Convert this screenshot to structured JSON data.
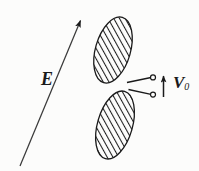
{
  "figure": {
    "type": "physics-diagram",
    "background_color": "#fcfcfb",
    "ink_color": "#1a1a1a",
    "width": 199,
    "height": 171
  },
  "labels": {
    "field": {
      "text": "E",
      "meaning": "electric-field-vector",
      "style": "bold-italic-serif"
    },
    "voltage": {
      "symbol": "V",
      "subscript": "0",
      "text": "V0",
      "meaning": "source-voltage",
      "style": "bold-italic-serif"
    }
  },
  "vectors": {
    "field_arrow": {
      "name": "E-field arrow",
      "x1": 20,
      "y1": 166,
      "x2": 84,
      "y2": 12,
      "direction": "up-right",
      "head": "filled-triangle"
    },
    "voltage_arrow": {
      "name": "V0 arrow",
      "x1": 163,
      "y1": 97,
      "x2": 163,
      "y2": 70,
      "direction": "up",
      "head": "filled-triangle"
    }
  },
  "plates": [
    {
      "name": "upper-plate",
      "cx": 113,
      "cy": 50,
      "rx": 17,
      "ry": 34,
      "rotation_deg": 16,
      "fill": "diagonal-hatch",
      "hatch_angle_deg": 45,
      "stroke": "#1a1a1a"
    },
    {
      "name": "lower-plate",
      "cx": 115,
      "cy": 125,
      "rx": 17,
      "ry": 35,
      "rotation_deg": 16,
      "fill": "diagonal-hatch",
      "hatch_angle_deg": 45,
      "stroke": "#1a1a1a"
    }
  ],
  "terminals": [
    {
      "name": "upper-terminal",
      "cx": 153,
      "cy": 78,
      "r": 2.6,
      "wire_from_x": 128,
      "wire_from_y": 82
    },
    {
      "name": "lower-terminal",
      "cx": 153,
      "cy": 94,
      "r": 2.6,
      "wire_from_x": 129,
      "wire_from_y": 90
    }
  ]
}
